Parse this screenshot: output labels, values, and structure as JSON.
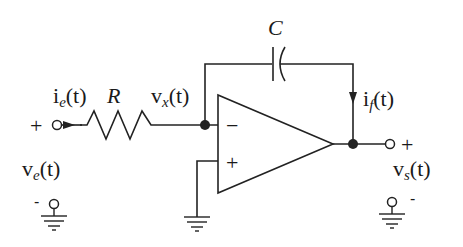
{
  "diagram": {
    "type": "op-amp integrator circuit",
    "colors": {
      "line": "#222222",
      "background": "#ffffff"
    },
    "components": {
      "resistor": {
        "label": "R"
      },
      "capacitor": {
        "label": "C"
      },
      "opamp": {
        "inverting_sign": "−",
        "noninverting_sign": "+"
      }
    },
    "labels": {
      "input_current": {
        "base": "i",
        "sub": "e",
        "arg": "(t)"
      },
      "node_voltage": {
        "base": "v",
        "sub": "x",
        "arg": "(t)"
      },
      "feedback_current": {
        "base": "i",
        "sub": "f",
        "arg": "(t)"
      },
      "input_voltage": {
        "base": "v",
        "sub": "e",
        "arg": "(t)"
      },
      "output_voltage": {
        "base": "v",
        "sub": "s",
        "arg": "(t)"
      }
    },
    "terminals": {
      "input_plus": "+",
      "input_minus": "-",
      "output_plus": "+",
      "output_minus": "-"
    }
  }
}
